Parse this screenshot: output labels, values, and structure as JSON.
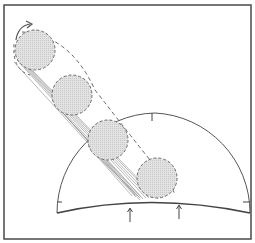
{
  "diagram": {
    "title": "",
    "colors": {
      "frame": "#4a4a4a",
      "line": "#555555",
      "ball_fill": "#d9d9d9",
      "ball_outline": "#6a6a6a",
      "streak": "#8a8a8a",
      "background": "#ffffff"
    },
    "balls": [
      {
        "cx": 35,
        "cy": 50,
        "r": 20
      },
      {
        "cx": 72,
        "cy": 95,
        "r": 20
      },
      {
        "cx": 108,
        "cy": 140,
        "r": 20
      },
      {
        "cx": 157,
        "cy": 178,
        "r": 20
      }
    ],
    "arrows": [
      {
        "label": "arrow-left",
        "x": 130
      },
      {
        "label": "arrow-right",
        "x": 179
      }
    ],
    "ticks": [
      "top-tick",
      "left-tick",
      "right-tick"
    ]
  }
}
